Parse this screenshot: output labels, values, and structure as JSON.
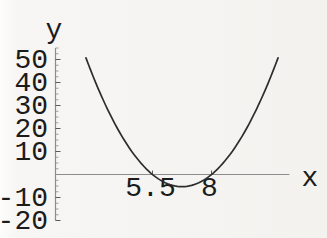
{
  "figure": {
    "background": "#f5f4f1",
    "curve_color": "#2d2d2d",
    "axis_color": "#8c8c8c",
    "tick_color": "#5a5a5a",
    "label_color": "#1b1b1b"
  },
  "chart_data": {
    "type": "line",
    "title": "",
    "xlabel": "x",
    "ylabel": "y",
    "xlim": [
      1.4,
      11.3
    ],
    "ylim": [
      -20,
      55
    ],
    "grid": false,
    "legend": null,
    "x_ticks": [
      {
        "value": 5.5,
        "label": "5.5"
      },
      {
        "value": 8,
        "label": "8"
      }
    ],
    "y_ticks": [
      {
        "value": 50,
        "label": "50"
      },
      {
        "value": 40,
        "label": "40"
      },
      {
        "value": 30,
        "label": "30"
      },
      {
        "value": 20,
        "label": "20"
      },
      {
        "value": 10,
        "label": "10"
      },
      {
        "value": -10,
        "label": "-10"
      },
      {
        "value": -20,
        "label": "-20"
      }
    ],
    "y_minor_tick_step": 2.5,
    "series": [
      {
        "name": "parabola",
        "equation": "y = a(x - r1)(x - r2)",
        "a": 3.38,
        "roots": [
          5.5,
          8
        ],
        "vertex": {
          "x": 6.75,
          "y": -5.3
        },
        "x_range": [
          2.68,
          10.82
        ],
        "points": [
          [
            2.7,
            50.2
          ],
          [
            3.0,
            42.3
          ],
          [
            3.5,
            30.4
          ],
          [
            4.0,
            20.3
          ],
          [
            4.5,
            11.8
          ],
          [
            5.0,
            5.1
          ],
          [
            5.5,
            0
          ],
          [
            6.0,
            -3.4
          ],
          [
            6.5,
            -5.1
          ],
          [
            6.75,
            -5.3
          ],
          [
            7.0,
            -5.1
          ],
          [
            7.5,
            -3.4
          ],
          [
            8.0,
            0
          ],
          [
            8.5,
            5.1
          ],
          [
            9.0,
            11.8
          ],
          [
            9.5,
            20.3
          ],
          [
            10.0,
            30.4
          ],
          [
            10.5,
            42.3
          ],
          [
            10.8,
            50.2
          ]
        ]
      }
    ]
  }
}
